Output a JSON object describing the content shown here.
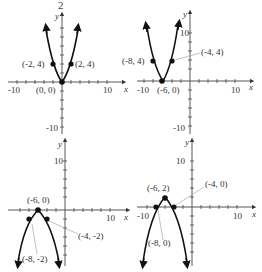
{
  "header": {
    "fragment": "2"
  },
  "axis_labels": {
    "x": "x",
    "y": "y"
  },
  "panels": [
    {
      "id": "top-left",
      "opens": "up",
      "x_ticks": [
        "-10",
        "10"
      ],
      "y_ticks": [
        "-10"
      ],
      "points": [
        {
          "label": "(-2, 4)",
          "x": -2,
          "y": 4
        },
        {
          "label": "(2, 4)",
          "x": 2,
          "y": 4
        },
        {
          "label": "(0, 0)",
          "x": 0,
          "y": 0
        }
      ]
    },
    {
      "id": "top-right",
      "opens": "up",
      "x_ticks": [
        "-10",
        "10"
      ],
      "y_ticks": [
        "10",
        "-10"
      ],
      "points": [
        {
          "label": "(-8, 4)",
          "x": -8,
          "y": 4
        },
        {
          "label": "(-4, 4)",
          "x": -4,
          "y": 4
        },
        {
          "label": "(-6, 0)",
          "x": -6,
          "y": 0
        }
      ]
    },
    {
      "id": "bottom-left",
      "opens": "down",
      "x_ticks": [
        "10"
      ],
      "y_ticks": [
        "10"
      ],
      "points": [
        {
          "label": "(-6, 0)",
          "x": -6,
          "y": 0
        },
        {
          "label": "(-4, -2)",
          "x": -4,
          "y": -2
        },
        {
          "label": "(-8, -2)",
          "x": -8,
          "y": -2
        }
      ]
    },
    {
      "id": "bottom-right",
      "opens": "down",
      "x_ticks": [
        "-10",
        "10"
      ],
      "y_ticks": [
        "10"
      ],
      "points": [
        {
          "label": "(-6, 2)",
          "x": -6,
          "y": 2
        },
        {
          "label": "(-4, 0)",
          "x": -4,
          "y": 0
        },
        {
          "label": "(-8, 0)",
          "x": -8,
          "y": 0
        }
      ]
    }
  ]
}
